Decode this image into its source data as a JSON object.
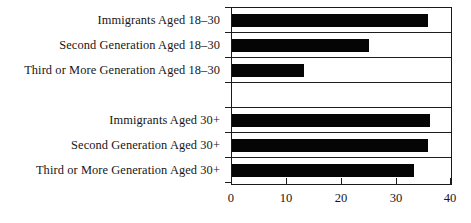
{
  "chart_data": {
    "type": "bar",
    "orientation": "horizontal",
    "title": "",
    "xlabel": "",
    "ylabel": "",
    "xlim": [
      0,
      40
    ],
    "xticks": [
      0,
      10,
      20,
      30,
      40
    ],
    "xtick_labels": [
      "0",
      "10",
      "20",
      "30",
      "40"
    ],
    "grid": false,
    "legend": null,
    "bar_color": "#050505",
    "frame_color": "#1a1a1a",
    "categories": [
      "Immigrants Aged 18–30",
      "Second Generation Aged 18–30",
      "Third or More Generation Aged 18–30",
      "",
      "Immigrants Aged 30+",
      "Second Generation Aged 30+",
      "Third or More Generation Aged 30+"
    ],
    "values": [
      35.8,
      25.0,
      13.1,
      null,
      36.2,
      35.8,
      33.2
    ],
    "groups": [
      {
        "name": "Aged 18–30",
        "categories": [
          "Immigrants Aged 18–30",
          "Second Generation Aged 18–30",
          "Third or More Generation Aged 18–30"
        ],
        "values": [
          35.8,
          25.0,
          13.1
        ]
      },
      {
        "name": "Aged 30+",
        "categories": [
          "Immigrants Aged 30+",
          "Second Generation Aged 30+",
          "Third or More Generation Aged 30+"
        ],
        "values": [
          36.2,
          35.8,
          33.2
        ]
      }
    ]
  },
  "caption": ""
}
